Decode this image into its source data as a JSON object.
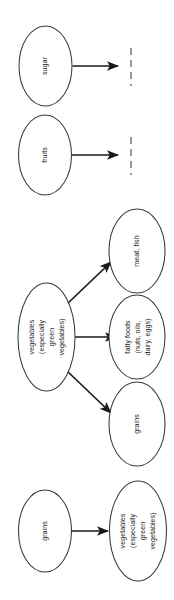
{
  "diagram": {
    "orientation": "rotated-90-ccw",
    "background_color": "#ffffff",
    "node_stroke_color": "#3a3a3a",
    "edge_color": "#1a1a1a",
    "stub_color": "#808080",
    "groups": [
      {
        "id": "group-sugar",
        "source": {
          "id": "node-sugar",
          "label": "sugar",
          "lines": [
            "sugar"
          ]
        },
        "targets": [
          {
            "id": "stub-sugar",
            "label": "",
            "kind": "dashed-stub"
          }
        ],
        "edges": [
          {
            "from": "node-sugar",
            "to": "stub-sugar",
            "kind": "arrow"
          }
        ]
      },
      {
        "id": "group-fruits",
        "source": {
          "id": "node-fruits",
          "label": "fruits",
          "lines": [
            "fruits"
          ]
        },
        "targets": [
          {
            "id": "stub-fruits",
            "label": "",
            "kind": "dashed-stub"
          }
        ],
        "edges": [
          {
            "from": "node-fruits",
            "to": "stub-fruits",
            "kind": "arrow"
          }
        ]
      },
      {
        "id": "group-vegetables",
        "source": {
          "id": "node-vegetables-source",
          "label": "vegetables (especially green vegetables)",
          "lines": [
            "vegetables",
            "(especially",
            "green",
            "vegetables)"
          ]
        },
        "targets": [
          {
            "id": "node-meat-fish",
            "label": "meat, fish",
            "lines": [
              "meat, fish"
            ]
          },
          {
            "id": "node-fatty-foods",
            "label": "fatty foods (nuts, oils, dairy, eggs)",
            "lines": [
              "fatty foods",
              "(nuts, oils,",
              "dairy, eggs)"
            ]
          },
          {
            "id": "node-grains-target",
            "label": "grains",
            "lines": [
              "grains"
            ]
          }
        ],
        "edges": [
          {
            "from": "node-vegetables-source",
            "to": "node-meat-fish",
            "kind": "arrow"
          },
          {
            "from": "node-vegetables-source",
            "to": "node-fatty-foods",
            "kind": "arrow"
          },
          {
            "from": "node-vegetables-source",
            "to": "node-grains-target",
            "kind": "arrow"
          }
        ]
      },
      {
        "id": "group-grains",
        "source": {
          "id": "node-grains-source",
          "label": "grains",
          "lines": [
            "grains"
          ]
        },
        "targets": [
          {
            "id": "node-vegetables-target",
            "label": "vegetables (especially green vegetables)",
            "lines": [
              "vegetables",
              "(especially",
              "green",
              "vegetables)"
            ]
          }
        ],
        "edges": [
          {
            "from": "node-grains-source",
            "to": "node-vegetables-target",
            "kind": "arrow"
          }
        ]
      }
    ]
  }
}
